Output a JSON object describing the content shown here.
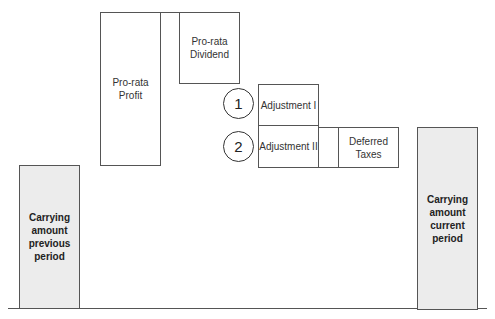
{
  "diagram": {
    "type": "waterfall-schematic",
    "boxes": [
      {
        "id": "carrying-previous",
        "label": "Carrying amount previous period",
        "lines": [
          "Carrying",
          "amount",
          "previous",
          "period"
        ],
        "fill": "#ececec"
      },
      {
        "id": "pro-rata-profit",
        "label": "Pro-rata Profit"
      },
      {
        "id": "pro-rata-dividend",
        "label": "Pro-rata Dividend",
        "lines": [
          "Pro-rata",
          "Dividend"
        ]
      },
      {
        "id": "adjustment-1",
        "label": "Adjustment I",
        "marker": "1"
      },
      {
        "id": "adjustment-2",
        "label": "Adjustment II",
        "marker": "2"
      },
      {
        "id": "deferred-taxes",
        "label": "Deferred Taxes",
        "lines": [
          "Deferred",
          "Taxes"
        ]
      },
      {
        "id": "carrying-current",
        "label": "Carrying amount current period",
        "lines": [
          "Carrying",
          "amount",
          "current",
          "period"
        ],
        "fill": "#ececec"
      }
    ],
    "markers": [
      "1",
      "2"
    ]
  }
}
